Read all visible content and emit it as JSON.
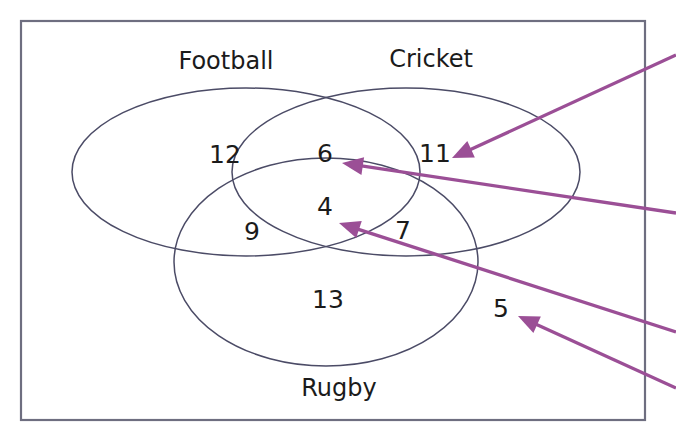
{
  "diagram": {
    "type": "venn-3-set",
    "title_visible": false,
    "frame": {
      "name": "universal-set-rectangle",
      "x": 21,
      "y": 21,
      "width": 624,
      "height": 399,
      "stroke_color": "#6e6e80"
    },
    "outline_color": "#4b4b66",
    "text_color": "#1b1b1b",
    "annotation_color": "#9b4f96",
    "sets": [
      {
        "id": "football",
        "label": "Football",
        "label_x": 226,
        "label_y": 62,
        "ellipse": {
          "cx": 246,
          "cy": 172,
          "rx": 174,
          "ry": 84,
          "rotation": 0
        }
      },
      {
        "id": "cricket",
        "label": "Cricket",
        "label_x": 431,
        "label_y": 60,
        "ellipse": {
          "cx": 406,
          "cy": 172,
          "rx": 174,
          "ry": 84,
          "rotation": 0
        }
      },
      {
        "id": "rugby",
        "label": "Rugby",
        "label_x": 339,
        "label_y": 389,
        "ellipse": {
          "cx": 326,
          "cy": 262,
          "rx": 152,
          "ry": 104,
          "rotation": 0
        }
      }
    ],
    "regions": [
      {
        "id": "football-only",
        "value": "12",
        "x": 225,
        "y": 156
      },
      {
        "id": "football-cricket-only",
        "value": "6",
        "x": 325,
        "y": 155
      },
      {
        "id": "cricket-only",
        "value": "11",
        "x": 435,
        "y": 155
      },
      {
        "id": "football-rugby-only",
        "value": "9",
        "x": 252,
        "y": 233
      },
      {
        "id": "all-three",
        "value": "4",
        "x": 325,
        "y": 208
      },
      {
        "id": "cricket-rugby-only",
        "value": "7",
        "x": 403,
        "y": 232
      },
      {
        "id": "rugby-only",
        "value": "13",
        "x": 328,
        "y": 301
      },
      {
        "id": "outside-all",
        "value": "5",
        "x": 501,
        "y": 310
      }
    ],
    "annotations": [
      {
        "id": "arrow-to-cricket-only",
        "target_region": "cricket-only",
        "tip_x": 452,
        "tip_y": 158,
        "tail_x": 676,
        "tail_y": 55,
        "angle_deg": 205
      },
      {
        "id": "arrow-to-football-cricket",
        "target_region": "football-cricket-only",
        "tip_x": 342,
        "tip_y": 163,
        "tail_x": 676,
        "tail_y": 213,
        "angle_deg": 171
      },
      {
        "id": "arrow-to-all-three",
        "target_region": "all-three",
        "tip_x": 339,
        "tip_y": 223,
        "tail_x": 676,
        "tail_y": 332,
        "angle_deg": 162
      },
      {
        "id": "arrow-to-outside-all",
        "target_region": "outside-all",
        "tip_x": 518,
        "tip_y": 316,
        "tail_x": 676,
        "tail_y": 388,
        "angle_deg": 155
      }
    ]
  }
}
